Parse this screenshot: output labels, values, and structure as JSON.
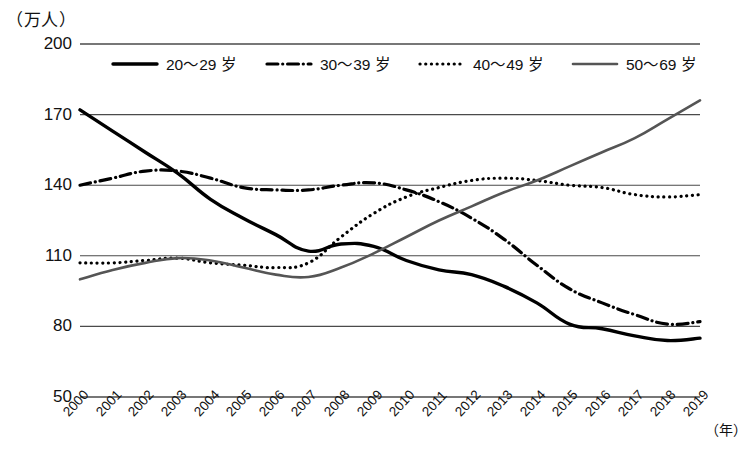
{
  "chart_data": {
    "type": "line",
    "title": "",
    "subtitle": "",
    "unit_label": "（万人）",
    "xlabel": "（年）",
    "ylabel": "",
    "ylim": [
      50,
      200
    ],
    "ytick_values": [
      200,
      170,
      140,
      110,
      80,
      50
    ],
    "ytick_labels": [
      "200",
      "170",
      "140",
      "110",
      "80",
      "50"
    ],
    "grid": true,
    "grid_axis": "y",
    "legend_position": "top-inside",
    "x": [
      2000,
      2001,
      2002,
      2003,
      2004,
      2005,
      2006,
      2007,
      2008,
      2009,
      2010,
      2011,
      2012,
      2013,
      2014,
      2015,
      2016,
      2017,
      2018,
      2019
    ],
    "xtick_labels": [
      "2000",
      "2001",
      "2002",
      "2003",
      "2004",
      "2005",
      "2006",
      "2007",
      "2008",
      "2009",
      "2010",
      "2011",
      "2012",
      "2013",
      "2014",
      "2015",
      "2016",
      "2017",
      "2018",
      "2019"
    ],
    "series": [
      {
        "name": "20～29 岁",
        "style": "solid",
        "color": "#000000",
        "width": 3.4,
        "values": [
          172,
          163,
          154,
          145,
          134,
          126,
          119,
          112,
          115,
          114,
          108,
          104,
          102,
          97,
          90,
          81,
          79,
          76,
          74,
          75
        ]
      },
      {
        "name": "30～39 岁",
        "style": "dash-dot",
        "color": "#000000",
        "width": 3.2,
        "values": [
          140,
          143,
          146,
          146,
          143,
          139,
          138,
          138,
          140,
          141,
          138,
          133,
          126,
          117,
          106,
          96,
          90,
          85,
          81,
          82
        ]
      },
      {
        "name": "40～49 岁",
        "style": "dotted",
        "color": "#000000",
        "width": 3.2,
        "values": [
          107,
          107,
          108,
          109,
          107,
          106,
          105,
          107,
          118,
          128,
          135,
          139,
          142,
          143,
          142,
          140,
          139,
          136,
          135,
          136
        ]
      },
      {
        "name": "50～69 岁",
        "style": "solid",
        "color": "#555555",
        "width": 2.6,
        "values": [
          100,
          104,
          107,
          109,
          108,
          105,
          102,
          101,
          105,
          111,
          118,
          125,
          131,
          137,
          142,
          148,
          154,
          160,
          168,
          176
        ]
      }
    ]
  },
  "legend": {
    "items": [
      {
        "label": "20～29 岁",
        "swatch": "solid-thick-black"
      },
      {
        "label": "30～39 岁",
        "swatch": "dash-dot-black"
      },
      {
        "label": "40～49 岁",
        "swatch": "dotted-black"
      },
      {
        "label": "50～69 岁",
        "swatch": "solid-gray"
      }
    ]
  }
}
